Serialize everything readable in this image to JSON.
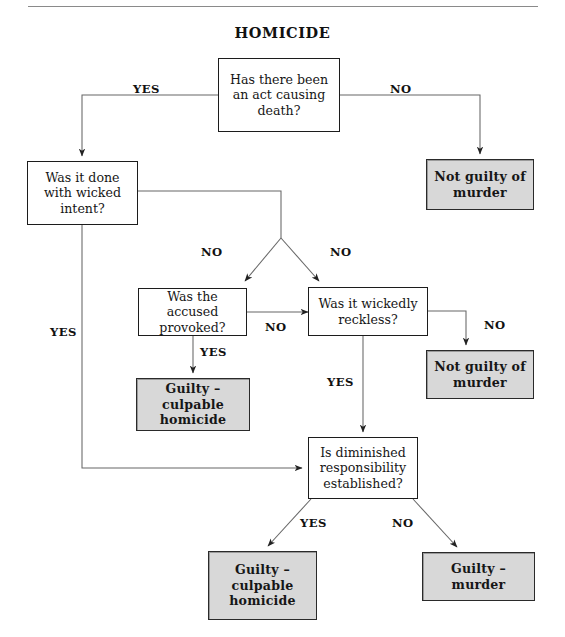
{
  "document": {
    "title": "HOMICIDE",
    "type": "decision-flowchart",
    "rule_divider": true
  },
  "colors": {
    "terminal_fill": "#d8d8d8",
    "box_border": "#1c1c1c",
    "line": "#555555",
    "text": "#161616",
    "page_background": "#ffffff"
  },
  "nodes": [
    {
      "id": "q-act",
      "kind": "decision",
      "text": "Has there been\nan act causing\ndeath?"
    },
    {
      "id": "q-intent",
      "kind": "decision",
      "text": "Was it done\nwith wicked\nintent?"
    },
    {
      "id": "t-notguilty-1",
      "kind": "terminal",
      "text": "Not guilty of\nmurder"
    },
    {
      "id": "q-provoked",
      "kind": "decision",
      "text": "Was the accused\nprovoked?"
    },
    {
      "id": "q-reckless",
      "kind": "decision",
      "text": "Was it wickedly\nreckless?"
    },
    {
      "id": "t-notguilty-2",
      "kind": "terminal",
      "text": "Not guilty of\nmurder"
    },
    {
      "id": "t-culpable-1",
      "kind": "terminal",
      "text": "Guilty –\nculpable\nhomicide"
    },
    {
      "id": "q-diminished",
      "kind": "decision",
      "text": "Is diminished\nresponsibility\nestablished?"
    },
    {
      "id": "t-culpable-2",
      "kind": "terminal",
      "text": "Guilty –\nculpable\nhomicide"
    },
    {
      "id": "t-murder",
      "kind": "terminal",
      "text": "Guilty –\nmurder"
    }
  ],
  "edge_labels": [
    {
      "id": "yes-act",
      "text": "YES"
    },
    {
      "id": "no-act",
      "text": "NO"
    },
    {
      "id": "no-intent-left",
      "text": "NO"
    },
    {
      "id": "no-intent-right",
      "text": "NO"
    },
    {
      "id": "yes-intent",
      "text": "YES"
    },
    {
      "id": "no-provoked",
      "text": "NO"
    },
    {
      "id": "yes-provoked",
      "text": "YES"
    },
    {
      "id": "no-reckless",
      "text": "NO"
    },
    {
      "id": "yes-reckless",
      "text": "YES"
    },
    {
      "id": "yes-diminished",
      "text": "YES"
    },
    {
      "id": "no-diminished",
      "text": "NO"
    }
  ],
  "flow": [
    {
      "from": "q-act",
      "answer": "YES",
      "to": "q-intent"
    },
    {
      "from": "q-act",
      "answer": "NO",
      "to": "t-notguilty-1"
    },
    {
      "from": "q-intent",
      "answer": "NO",
      "to": "q-provoked"
    },
    {
      "from": "q-intent",
      "answer": "NO",
      "to": "q-reckless"
    },
    {
      "from": "q-intent",
      "answer": "YES",
      "to": "q-diminished"
    },
    {
      "from": "q-provoked",
      "answer": "YES",
      "to": "t-culpable-1"
    },
    {
      "from": "q-provoked",
      "answer": "NO",
      "to": "q-reckless"
    },
    {
      "from": "q-reckless",
      "answer": "NO",
      "to": "t-notguilty-2"
    },
    {
      "from": "q-reckless",
      "answer": "YES",
      "to": "q-diminished"
    },
    {
      "from": "q-diminished",
      "answer": "YES",
      "to": "t-culpable-2"
    },
    {
      "from": "q-diminished",
      "answer": "NO",
      "to": "t-murder"
    }
  ]
}
